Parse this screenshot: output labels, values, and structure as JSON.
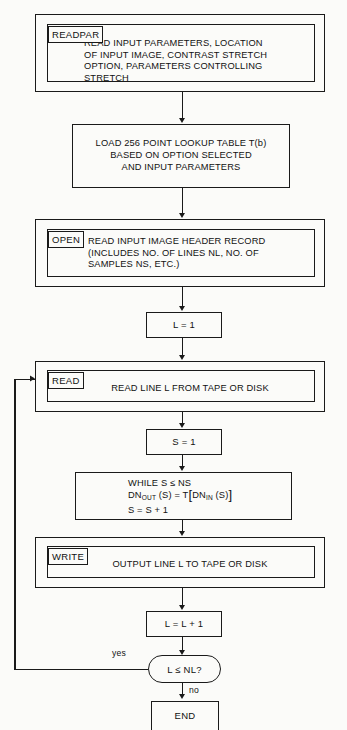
{
  "diagram": {
    "type": "flowchart",
    "colors": {
      "line": "#1a1a1a",
      "background": "#fbfbf9",
      "text": "#111111"
    }
  },
  "nodes": {
    "readpar": {
      "tab_label": "READPAR",
      "body_lines": "READ INPUT PARAMETERS, LOCATION\nOF INPUT IMAGE, CONTRAST STRETCH\nOPTION, PARAMETERS CONTROLLING\nSTRETCH"
    },
    "load_table": {
      "body_lines": "LOAD 256 POINT LOOKUP TABLE T(b)\nBASED ON OPTION SELECTED\nAND INPUT PARAMETERS"
    },
    "open": {
      "tab_label": "OPEN",
      "body_lines": "READ INPUT IMAGE HEADER RECORD\n(INCLUDES NO. OF LINES NL, NO. OF\nSAMPLES NS, ETC.)"
    },
    "init_line": {
      "label": "L = 1"
    },
    "read": {
      "tab_label": "READ",
      "body_lines": "READ LINE L FROM TAPE OR DISK"
    },
    "init_sample": {
      "label": "S = 1"
    },
    "while_loop": {
      "line1": "WHILE S ≤ NS",
      "line2_prefix": "DN",
      "line2_sub1": "OUT",
      "line2_mid": " (S) = T",
      "line2_bracket_open": "[",
      "line2_dn": "DN",
      "line2_sub2": "IN",
      "line2_tail": " (S)",
      "line2_bracket_close": "]",
      "line2_plain": "DNOUT (S) = T[DNIN (S)]",
      "line3": "S = S + 1"
    },
    "write": {
      "tab_label": "WRITE",
      "body_lines": "OUTPUT LINE L TO TAPE OR DISK"
    },
    "increment_line": {
      "label": "L = L + 1"
    },
    "decision": {
      "label": "L ≤ NL?",
      "yes_label": "yes",
      "no_label": "no"
    },
    "end": {
      "label": "END"
    }
  }
}
